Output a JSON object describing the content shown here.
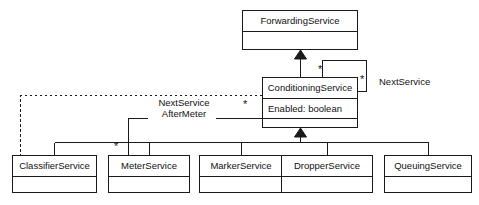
{
  "diagram": {
    "type": "uml-class-diagram",
    "title": "",
    "background_color": "#ffffff",
    "line_color": "#1a1a1a",
    "text_color": "#111111"
  },
  "classes": [
    {
      "id": "forwarding-service",
      "name": "ForwardingService",
      "attributes": [],
      "empty_compartments": 1,
      "x": 242,
      "y": 10,
      "width": 116,
      "height": 40
    },
    {
      "id": "conditioning-service",
      "name": "ConditioningService",
      "attributes": [
        "Enabled: boolean"
      ],
      "empty_compartments": 1,
      "x": 262,
      "y": 77,
      "width": 96,
      "height": 51
    },
    {
      "id": "classifier-service",
      "name": "ClassifierService",
      "attributes": [],
      "empty_compartments": 1,
      "x": 12,
      "y": 155,
      "width": 85,
      "height": 38
    },
    {
      "id": "meter-service",
      "name": "MeterService",
      "attributes": [],
      "empty_compartments": 1,
      "x": 108,
      "y": 155,
      "width": 82,
      "height": 38
    },
    {
      "id": "marker-service",
      "name": "MarkerService",
      "attributes": [],
      "empty_compartments": 1,
      "x": 199,
      "y": 155,
      "width": 84,
      "height": 38
    },
    {
      "id": "dropper-service",
      "name": "DropperService",
      "attributes": [],
      "empty_compartments": 1,
      "x": 281,
      "y": 155,
      "width": 92,
      "height": 38
    },
    {
      "id": "queuing-service",
      "name": "QueuingService",
      "attributes": [],
      "empty_compartments": 1,
      "x": 384,
      "y": 155,
      "width": 88,
      "height": 38
    }
  ],
  "relationships": {
    "generalizations": [
      {
        "id": "gen-conditioning-to-forwarding",
        "from": "conditioning-service",
        "to": "forwarding-service",
        "style": "solid",
        "arrow": "hollow-triangle-filled"
      },
      {
        "id": "gen-subclasses-to-conditioning",
        "from": [
          "classifier-service",
          "meter-service",
          "marker-service",
          "dropper-service",
          "queuing-service"
        ],
        "to": "conditioning-service",
        "style": "solid",
        "arrow": "hollow-triangle-filled"
      }
    ],
    "associations": [
      {
        "id": "assoc-next-service-self",
        "name": "NextService",
        "from": "conditioning-service",
        "to": "conditioning-service",
        "style": "solid",
        "source_multiplicity": "*",
        "target_multiplicity": "*"
      },
      {
        "id": "assoc-next-service-after-meter",
        "name_line1": "NextService",
        "name_line2": "AfterMeter",
        "from": "conditioning-service",
        "to": "meter-service",
        "style": "solid",
        "source_multiplicity": "*",
        "target_multiplicity": "*"
      }
    ],
    "dependencies": [
      {
        "id": "dep-classifier-to-conditioning",
        "from": "classifier-service",
        "to": "conditioning-service",
        "style": "dashed"
      }
    ]
  },
  "multiplicity_markers": [
    {
      "id": "mult-self-top",
      "label": "*",
      "x": 318,
      "y": 64
    },
    {
      "id": "mult-self-right",
      "label": "*",
      "x": 360,
      "y": 74
    },
    {
      "id": "mult-after-meter-top",
      "label": "*",
      "x": 243,
      "y": 99
    },
    {
      "id": "mult-after-meter-bot",
      "label": "*",
      "x": 114,
      "y": 141
    }
  ],
  "edge_labels": [
    {
      "id": "label-next-service-self",
      "text": "NextService",
      "x": 379,
      "y": 76
    },
    {
      "id": "label-next-service-after-meter-line1",
      "text": "NextService",
      "x": 164,
      "y": 102
    },
    {
      "id": "label-next-service-after-meter-line2",
      "text": "AfterMeter",
      "x": 164,
      "y": 113
    }
  ]
}
